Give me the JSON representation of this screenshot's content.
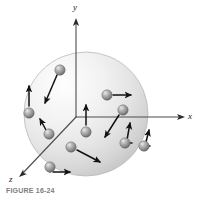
{
  "figure": {
    "caption": "FIGURE 16-24",
    "background_color": "#ffffff"
  },
  "axes": {
    "origin": {
      "x": 76,
      "y": 117
    },
    "stroke_color": "#4d4d4d",
    "labels": {
      "y": "y",
      "x": "x",
      "z": "z"
    },
    "lines": [
      {
        "name": "y-axis",
        "label": "y",
        "x1": 76,
        "y1": 117,
        "x2": 76,
        "y2": 19
      },
      {
        "name": "x-axis",
        "label": "x",
        "x1": 76,
        "y1": 117,
        "x2": 184,
        "y2": 117
      },
      {
        "name": "z-axis",
        "label": "z",
        "x1": 76,
        "y1": 117,
        "x2": 20,
        "y2": 176
      }
    ]
  },
  "sphere": {
    "center_x": 86,
    "center_y": 114,
    "radius": 62,
    "highlight_color": "#fdfdfd",
    "mid_color": "#e2e2e2",
    "edge_color": "#c6c6c6",
    "outline_color": "#b4b4b4"
  },
  "particles": [
    {
      "id": 1,
      "cx": 29,
      "cy": 113,
      "r": 5.2,
      "vx1": 29,
      "vy1": 106,
      "vx2": 29,
      "vy2": 84
    },
    {
      "id": 2,
      "cx": 60,
      "cy": 70,
      "r": 5.2,
      "vx1": 57,
      "vy1": 75,
      "vx2": 44,
      "vy2": 105
    },
    {
      "id": 3,
      "cx": 49,
      "cy": 134,
      "r": 5.2,
      "vx1": 46,
      "vy1": 129,
      "vx2": 40,
      "vy2": 117
    },
    {
      "id": 4,
      "cx": 86,
      "cy": 132,
      "r": 5.2,
      "vx1": 86,
      "vy1": 125,
      "vx2": 86,
      "vy2": 103
    },
    {
      "id": 5,
      "cx": 107,
      "cy": 95,
      "r": 5.2,
      "vx1": 113,
      "vy1": 95,
      "vx2": 133,
      "vy2": 95
    },
    {
      "id": 6,
      "cx": 123,
      "cy": 110,
      "r": 5.2,
      "vx1": 119,
      "vy1": 115,
      "vx2": 104,
      "vy2": 139
    },
    {
      "id": 7,
      "cx": 125,
      "cy": 143,
      "r": 5.2,
      "vx1": 128,
      "vy1": 139,
      "vx2": 130,
      "vy2": 121
    },
    {
      "id": 8,
      "cx": 71,
      "cy": 147,
      "r": 5.2,
      "vx1": 77,
      "vy1": 150,
      "vx2": 102,
      "vy2": 163
    },
    {
      "id": 9,
      "cx": 50,
      "cy": 167,
      "r": 5.2,
      "vx1": 54,
      "vy1": 172,
      "vx2": 72,
      "vy2": 172
    },
    {
      "id": 10,
      "cx": 144,
      "cy": 146,
      "r": 5.2,
      "vx1": 147,
      "vy1": 141,
      "vx2": 150,
      "vy2": 128
    }
  ],
  "particle_style": {
    "highlight_color": "#e8e8e8",
    "body_color": "#9a9a9a",
    "shadow_color": "#5f5f5f",
    "outline_color": "#6a6a6a"
  },
  "arrow_style": {
    "color": "#121212",
    "stroke_width": 1.5,
    "head_length": 5
  }
}
